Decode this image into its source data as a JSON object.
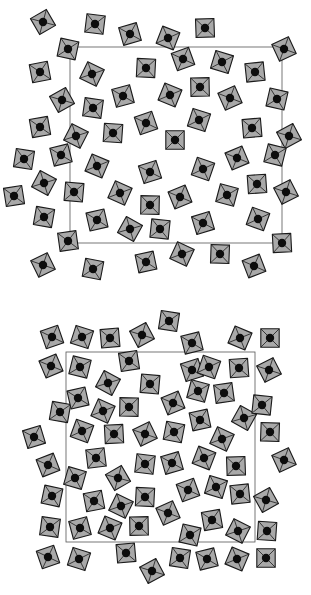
{
  "figure": {
    "colors": {
      "polyhedron_fill": "#a9a9a9",
      "edge": "#1a1a1a",
      "atom": "#0d0d0d",
      "unit_cell": "#555555",
      "background": "#ffffff"
    },
    "panels": [
      {
        "id": "top",
        "unit_cell": {
          "x": 70,
          "y": 47,
          "w": 212,
          "h": 196
        },
        "units": [
          [
            43,
            22
          ],
          [
            95,
            24
          ],
          [
            130,
            34
          ],
          [
            168,
            38
          ],
          [
            205,
            28
          ],
          [
            284,
            49
          ],
          [
            68,
            49
          ],
          [
            40,
            72
          ],
          [
            92,
            74
          ],
          [
            146,
            68
          ],
          [
            183,
            59
          ],
          [
            222,
            62
          ],
          [
            255,
            72
          ],
          [
            62,
            100
          ],
          [
            93,
            108
          ],
          [
            123,
            96
          ],
          [
            170,
            95
          ],
          [
            200,
            87
          ],
          [
            230,
            98
          ],
          [
            277,
            99
          ],
          [
            40,
            127
          ],
          [
            76,
            136
          ],
          [
            113,
            133
          ],
          [
            146,
            123
          ],
          [
            199,
            120
          ],
          [
            252,
            128
          ],
          [
            289,
            136
          ],
          [
            24,
            159
          ],
          [
            61,
            155
          ],
          [
            97,
            166
          ],
          [
            175,
            140
          ],
          [
            237,
            158
          ],
          [
            275,
            155
          ],
          [
            14,
            196
          ],
          [
            44,
            183
          ],
          [
            74,
            192
          ],
          [
            150,
            172
          ],
          [
            203,
            169
          ],
          [
            257,
            184
          ],
          [
            286,
            192
          ],
          [
            44,
            217
          ],
          [
            97,
            220
          ],
          [
            120,
            193
          ],
          [
            150,
            205
          ],
          [
            180,
            197
          ],
          [
            227,
            195
          ],
          [
            68,
            241
          ],
          [
            130,
            229
          ],
          [
            160,
            229
          ],
          [
            203,
            223
          ],
          [
            258,
            219
          ],
          [
            282,
            243
          ],
          [
            43,
            265
          ],
          [
            93,
            269
          ],
          [
            146,
            262
          ],
          [
            182,
            254
          ],
          [
            220,
            254
          ],
          [
            254,
            266
          ]
        ]
      },
      {
        "id": "bottom",
        "unit_cell": {
          "x": 66,
          "y": 57,
          "w": 189,
          "h": 190
        },
        "units": [
          [
            52,
            42
          ],
          [
            82,
            42
          ],
          [
            110,
            43
          ],
          [
            142,
            40
          ],
          [
            169,
            26
          ],
          [
            192,
            48
          ],
          [
            240,
            43
          ],
          [
            270,
            43
          ],
          [
            51,
            71
          ],
          [
            80,
            72
          ],
          [
            129,
            66
          ],
          [
            108,
            88
          ],
          [
            150,
            89
          ],
          [
            192,
            75
          ],
          [
            209,
            72
          ],
          [
            239,
            73
          ],
          [
            269,
            75
          ],
          [
            60,
            117
          ],
          [
            78,
            103
          ],
          [
            103,
            116
          ],
          [
            129,
            112
          ],
          [
            173,
            108
          ],
          [
            198,
            96
          ],
          [
            224,
            98
          ],
          [
            244,
            123
          ],
          [
            262,
            110
          ],
          [
            34,
            142
          ],
          [
            82,
            136
          ],
          [
            114,
            139
          ],
          [
            145,
            139
          ],
          [
            174,
            137
          ],
          [
            200,
            125
          ],
          [
            222,
            144
          ],
          [
            270,
            137
          ],
          [
            48,
            170
          ],
          [
            75,
            183
          ],
          [
            96,
            163
          ],
          [
            118,
            183
          ],
          [
            145,
            169
          ],
          [
            172,
            168
          ],
          [
            204,
            163
          ],
          [
            236,
            171
          ],
          [
            284,
            165
          ],
          [
            52,
            201
          ],
          [
            94,
            206
          ],
          [
            121,
            211
          ],
          [
            145,
            202
          ],
          [
            188,
            195
          ],
          [
            216,
            192
          ],
          [
            240,
            199
          ],
          [
            266,
            205
          ],
          [
            50,
            232
          ],
          [
            80,
            233
          ],
          [
            110,
            233
          ],
          [
            139,
            231
          ],
          [
            168,
            218
          ],
          [
            190,
            240
          ],
          [
            212,
            225
          ],
          [
            238,
            236
          ],
          [
            267,
            236
          ],
          [
            48,
            262
          ],
          [
            79,
            264
          ],
          [
            126,
            258
          ],
          [
            152,
            276
          ],
          [
            180,
            263
          ],
          [
            207,
            264
          ],
          [
            237,
            264
          ],
          [
            266,
            263
          ]
        ]
      }
    ],
    "unit_size": 13
  }
}
